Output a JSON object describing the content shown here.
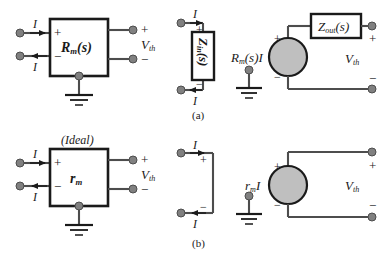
{
  "figure": {
    "background_color": "#ffffff",
    "wire_color": "#4d4d4d",
    "box_color": "#1a1a1a",
    "node_color": "#808080",
    "source_fill": "#bfbfbf",
    "text_color": "#1a1a1a"
  },
  "captions": {
    "a": "(a)",
    "b": "(b)"
  },
  "symbols": {
    "plus": "+",
    "minus": "−",
    "current": "I",
    "ideal": "(Ideal)"
  },
  "panel_a": {
    "block": {
      "name": "transresistance-block",
      "label_main": "R",
      "label_sub": "m",
      "label_tail": "(s)",
      "input_plus": "+",
      "input_minus": "−",
      "in_current_top": "I",
      "in_current_bottom": "I",
      "out_plus": "+",
      "out_minus": "−",
      "out_label_main": "V",
      "out_label_sub": "th"
    },
    "input_impedance": {
      "name": "input-impedance-block",
      "label_main": "Z",
      "label_sub": "in",
      "label_tail": "(s)",
      "plus": "+",
      "minus": "−",
      "in_current_top": "I",
      "in_current_bottom": "I"
    },
    "thevenin": {
      "name": "thevenin-equivalent",
      "source_main": "R",
      "source_sub": "m",
      "source_tail": "(s)I",
      "source_plus": "+",
      "source_minus": "−",
      "out_impedance_main": "Z",
      "out_impedance_sub": "out",
      "out_impedance_tail": "(s)",
      "out_plus": "+",
      "out_minus": "−",
      "out_label_main": "V",
      "out_label_sub": "th"
    }
  },
  "panel_b": {
    "block": {
      "name": "ideal-transresistance-block",
      "ideal_note": "(Ideal)",
      "label_main": "r",
      "label_sub": "m",
      "input_plus": "+",
      "input_minus": "−",
      "in_current_top": "I",
      "in_current_bottom": "I",
      "out_plus": "+",
      "out_minus": "−",
      "out_label_main": "V",
      "out_label_sub": "th"
    },
    "short_circuit": {
      "name": "short-circuit-input",
      "plus": "+",
      "minus": "−",
      "in_current_top": "I",
      "in_current_bottom": "I"
    },
    "thevenin": {
      "name": "ideal-thevenin-equivalent",
      "source_main": "r",
      "source_sub": "m",
      "source_tail": "I",
      "source_plus": "+",
      "source_minus": "−",
      "out_plus": "+",
      "out_minus": "−",
      "out_label_main": "V",
      "out_label_sub": "th"
    }
  }
}
